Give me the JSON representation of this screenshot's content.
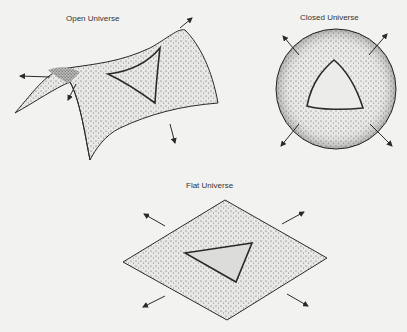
{
  "diagram": {
    "panels": [
      {
        "id": "open",
        "title": "Open Universe",
        "shape": "saddle",
        "curvature": "negative"
      },
      {
        "id": "closed",
        "title": "Closed Universe",
        "shape": "sphere",
        "curvature": "positive"
      },
      {
        "id": "flat",
        "title": "Flat Universe",
        "shape": "plane",
        "curvature": "zero"
      }
    ],
    "colors": {
      "background": "#f2f2f0",
      "stroke": "#2a2a2a",
      "stipple": "#555555"
    }
  }
}
